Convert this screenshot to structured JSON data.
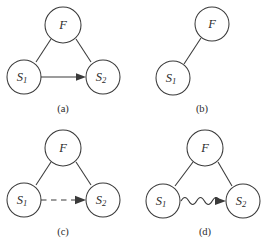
{
  "figure": {
    "background_color": "#ffffff",
    "stroke_color": "#3a3a3a",
    "width": 265,
    "height": 245
  },
  "panels": [
    {
      "id": "a",
      "caption": "(a)",
      "nodes": [
        {
          "id": "F",
          "label": "F",
          "sub": "",
          "cx": 63,
          "cy": 25,
          "r": 18
        },
        {
          "id": "S1",
          "label": "S",
          "sub": "1",
          "cx": 24,
          "cy": 77,
          "r": 17
        },
        {
          "id": "S2",
          "label": "S",
          "sub": "2",
          "cx": 103,
          "cy": 77,
          "r": 17
        }
      ],
      "edges": [
        {
          "from": "F",
          "to": "S1",
          "style": "solid",
          "arrow": false
        },
        {
          "from": "F",
          "to": "S2",
          "style": "solid",
          "arrow": false
        },
        {
          "from": "S1",
          "to": "S2",
          "style": "solid",
          "arrow": true
        }
      ]
    },
    {
      "id": "b",
      "caption": "(b)",
      "nodes": [
        {
          "id": "F",
          "label": "F",
          "sub": "",
          "cx": 79,
          "cy": 24,
          "r": 17
        },
        {
          "id": "S1",
          "label": "S",
          "sub": "1",
          "cx": 40,
          "cy": 78,
          "r": 17
        }
      ],
      "edges": [
        {
          "from": "F",
          "to": "S1",
          "style": "solid",
          "arrow": false
        }
      ]
    },
    {
      "id": "c",
      "caption": "(c)",
      "nodes": [
        {
          "id": "F",
          "label": "F",
          "sub": "",
          "cx": 63,
          "cy": 25,
          "r": 18
        },
        {
          "id": "S1",
          "label": "S",
          "sub": "1",
          "cx": 24,
          "cy": 77,
          "r": 17
        },
        {
          "id": "S2",
          "label": "S",
          "sub": "2",
          "cx": 103,
          "cy": 77,
          "r": 17
        }
      ],
      "edges": [
        {
          "from": "F",
          "to": "S1",
          "style": "solid",
          "arrow": false
        },
        {
          "from": "F",
          "to": "S2",
          "style": "solid",
          "arrow": false
        },
        {
          "from": "S1",
          "to": "S2",
          "style": "dashed",
          "arrow": true
        }
      ]
    },
    {
      "id": "d",
      "caption": "(d)",
      "nodes": [
        {
          "id": "F",
          "label": "F",
          "sub": "",
          "cx": 72,
          "cy": 25,
          "r": 18
        },
        {
          "id": "S1",
          "label": "S",
          "sub": "1",
          "cx": 30,
          "cy": 78,
          "r": 17
        },
        {
          "id": "S2",
          "label": "S",
          "sub": "2",
          "cx": 110,
          "cy": 78,
          "r": 17
        }
      ],
      "edges": [
        {
          "from": "F",
          "to": "S1",
          "style": "solid",
          "arrow": false
        },
        {
          "from": "F",
          "to": "S2",
          "style": "solid",
          "arrow": false
        },
        {
          "from": "S1",
          "to": "S2",
          "style": "wavy",
          "arrow": true,
          "cycles": 5,
          "amplitude": 5
        }
      ]
    }
  ]
}
